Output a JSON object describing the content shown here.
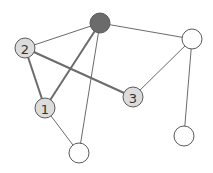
{
  "diagram": {
    "type": "graph",
    "nodes": [
      {
        "id": "top",
        "label": "",
        "x": 100,
        "y": 23,
        "r": 10,
        "fill": "#6b6b6b"
      },
      {
        "id": "n2",
        "label": "2",
        "x": 25,
        "y": 48,
        "r": 10,
        "fill": "#dcdcdc"
      },
      {
        "id": "n1",
        "label": "1",
        "x": 45,
        "y": 108,
        "r": 10,
        "fill": "#dcdcdc"
      },
      {
        "id": "n3",
        "label": "3",
        "x": 133,
        "y": 97,
        "r": 10,
        "fill": "#dcdcdc"
      },
      {
        "id": "tr",
        "label": "",
        "x": 192,
        "y": 39,
        "r": 10,
        "fill": "#ffffff"
      },
      {
        "id": "br",
        "label": "",
        "x": 184,
        "y": 136,
        "r": 10,
        "fill": "#ffffff"
      },
      {
        "id": "bot",
        "label": "",
        "x": 79,
        "y": 153,
        "r": 10,
        "fill": "#ffffff"
      }
    ],
    "edges": [
      {
        "from": "top",
        "to": "n2",
        "weight": "thin"
      },
      {
        "from": "top",
        "to": "n1",
        "weight": "thick"
      },
      {
        "from": "top",
        "to": "bot",
        "weight": "thin"
      },
      {
        "from": "top",
        "to": "tr",
        "weight": "thin"
      },
      {
        "from": "n2",
        "to": "n3",
        "weight": "thick"
      },
      {
        "from": "n2",
        "to": "n1",
        "weight": "thick"
      },
      {
        "from": "n1",
        "to": "bot",
        "weight": "thin"
      },
      {
        "from": "n3",
        "to": "tr",
        "weight": "thin"
      },
      {
        "from": "tr",
        "to": "br",
        "weight": "thin"
      }
    ]
  }
}
